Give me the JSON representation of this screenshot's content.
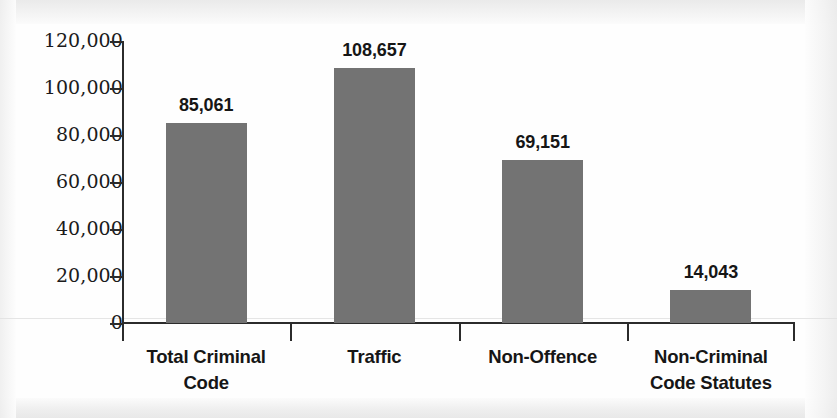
{
  "chart_data": {
    "type": "bar",
    "title": "",
    "subtitle": "",
    "xlabel": "",
    "ylabel": "",
    "categories": [
      "Total Criminal Code",
      "Traffic",
      "Non-Offence",
      "Non-Criminal Code Statutes"
    ],
    "category_lines": [
      [
        "Total Criminal",
        "Code"
      ],
      [
        "Traffic",
        ""
      ],
      [
        "Non-Offence",
        ""
      ],
      [
        "Non-Criminal",
        "Code Statutes"
      ]
    ],
    "values": [
      85061,
      108657,
      69151,
      14043
    ],
    "value_labels": [
      "85,061",
      "108,657",
      "69,151",
      "14,043"
    ],
    "ylim": [
      0,
      120000
    ],
    "ytick_values": [
      120000,
      100000,
      80000,
      60000,
      40000,
      20000,
      0
    ],
    "ytick_labels": [
      "120,000",
      "100,000",
      "80,000",
      "60,000",
      "40,000",
      "20,000",
      "0"
    ],
    "grid": false,
    "legend": false,
    "legend_position": "none",
    "bar_color": "#737373",
    "axis_color": "#2b2b2b",
    "text_color": "#161616",
    "background_color": "#fefefe"
  }
}
